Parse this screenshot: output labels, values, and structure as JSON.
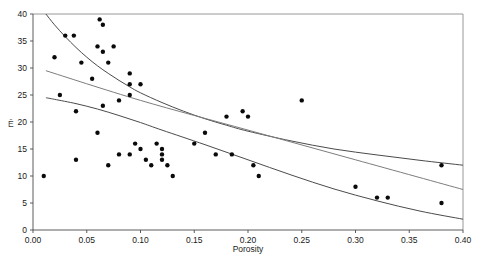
{
  "chart_data": {
    "type": "scatter",
    "title": "",
    "xlabel": "Porosity",
    "ylabel": "Ē",
    "xlim": [
      0.0,
      0.4
    ],
    "ylim": [
      0,
      40
    ],
    "grid": false,
    "legend": "none",
    "xticks": [
      "0.00",
      "0.05",
      "0.10",
      "0.15",
      "0.20",
      "0.25",
      "0.30",
      "0.35",
      "0.40"
    ],
    "xtick_values": [
      0.0,
      0.05,
      0.1,
      0.15,
      0.2,
      0.25,
      0.3,
      0.35,
      0.4
    ],
    "yticks": [
      "0",
      "5",
      "10",
      "15",
      "20",
      "25",
      "30",
      "35",
      "40"
    ],
    "ytick_values": [
      0,
      5,
      10,
      15,
      20,
      25,
      30,
      35,
      40
    ],
    "x": [
      0.01,
      0.02,
      0.025,
      0.03,
      0.038,
      0.04,
      0.04,
      0.045,
      0.055,
      0.06,
      0.06,
      0.062,
      0.065,
      0.065,
      0.065,
      0.07,
      0.07,
      0.075,
      0.08,
      0.08,
      0.09,
      0.09,
      0.09,
      0.09,
      0.095,
      0.1,
      0.1,
      0.105,
      0.11,
      0.115,
      0.12,
      0.12,
      0.12,
      0.125,
      0.13,
      0.15,
      0.16,
      0.17,
      0.18,
      0.185,
      0.195,
      0.2,
      0.205,
      0.21,
      0.25,
      0.3,
      0.32,
      0.33,
      0.38,
      0.38
    ],
    "y": [
      10,
      32,
      25,
      36,
      36,
      22,
      13,
      31,
      28,
      18,
      34,
      39,
      38,
      33,
      23,
      12,
      31,
      34,
      24,
      14,
      29,
      27,
      25,
      14,
      16,
      27,
      15,
      13,
      12,
      16,
      15,
      13,
      14,
      12,
      10,
      16,
      18,
      14,
      21,
      14,
      22,
      21,
      12,
      10,
      24,
      8,
      6,
      6,
      12,
      5
    ],
    "series": [
      {
        "name": "upper-confidence-curve",
        "type": "line",
        "x": [
          0.012,
          0.02,
          0.03,
          0.04,
          0.05,
          0.06,
          0.07,
          0.08,
          0.09,
          0.1,
          0.12,
          0.14,
          0.16,
          0.18,
          0.2,
          0.24,
          0.28,
          0.32,
          0.36,
          0.4
        ],
        "y": [
          40.0,
          38.0,
          35.8,
          33.8,
          32.0,
          30.4,
          29.0,
          27.7,
          26.5,
          25.4,
          23.6,
          22.0,
          20.6,
          19.4,
          18.3,
          16.5,
          15.0,
          13.9,
          12.9,
          12.0
        ]
      },
      {
        "name": "regression-line",
        "type": "line",
        "x": [
          0.012,
          0.1,
          0.2,
          0.3,
          0.4
        ],
        "y": [
          29.5,
          24.0,
          18.5,
          13.0,
          7.5
        ]
      },
      {
        "name": "lower-confidence-curve",
        "type": "line",
        "x": [
          0.012,
          0.02,
          0.04,
          0.06,
          0.08,
          0.1,
          0.12,
          0.16,
          0.2,
          0.24,
          0.28,
          0.32,
          0.36,
          0.4
        ],
        "y": [
          24.5,
          24.2,
          23.4,
          22.4,
          21.2,
          19.9,
          18.5,
          15.8,
          13.0,
          10.2,
          7.6,
          5.4,
          3.5,
          2.0
        ]
      }
    ]
  },
  "axes": {
    "x_title": "Porosity",
    "y_title": "Ē"
  }
}
